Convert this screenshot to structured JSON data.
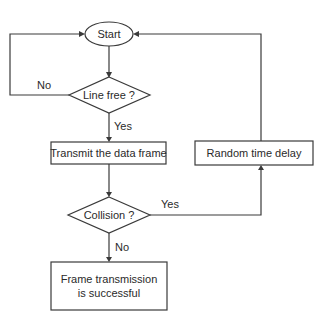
{
  "diagram": {
    "type": "flowchart",
    "nodes": {
      "start": {
        "label": "Start",
        "shape": "ellipse"
      },
      "line_free": {
        "label": "Line free ?",
        "shape": "diamond"
      },
      "transmit": {
        "label": "Transmit the data frame",
        "shape": "rectangle"
      },
      "collision": {
        "label": "Collision ?",
        "shape": "diamond"
      },
      "success": {
        "label_line1": "Frame transmission",
        "label_line2": "is successful",
        "shape": "rectangle"
      },
      "random_delay": {
        "label": "Random time delay",
        "shape": "rectangle"
      }
    },
    "edges": {
      "start_to_line_free": {
        "label": ""
      },
      "line_free_no": {
        "label": "No",
        "from": "line_free",
        "to": "start"
      },
      "line_free_yes": {
        "label": "Yes",
        "from": "line_free",
        "to": "transmit"
      },
      "transmit_to_collision": {
        "label": ""
      },
      "collision_yes": {
        "label": "Yes",
        "from": "collision",
        "to": "random_delay"
      },
      "collision_no": {
        "label": "No",
        "from": "collision",
        "to": "success"
      },
      "delay_to_start": {
        "label": "",
        "from": "random_delay",
        "to": "start"
      }
    },
    "colors": {
      "stroke": "#3a3a3a",
      "text": "#2a2a2a",
      "background": "#ffffff"
    }
  }
}
